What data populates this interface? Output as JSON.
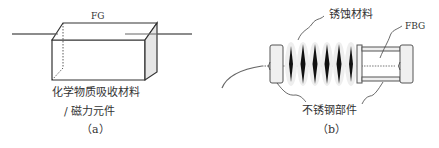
{
  "panel_a": {
    "fiber_label": "FG",
    "material_label_line1": "化学物质吸收材料",
    "material_label_line2": "/  磁力元件",
    "caption": "（a）"
  },
  "panel_b": {
    "corrosion_label": "锈蚀材料",
    "fbg_label": "FBG",
    "steel_label": "不锈钢部件",
    "caption": "（b）"
  },
  "colors": {
    "line": "#555555",
    "spiral_dark": "#111111",
    "part_fill": "#f2f2f2"
  }
}
